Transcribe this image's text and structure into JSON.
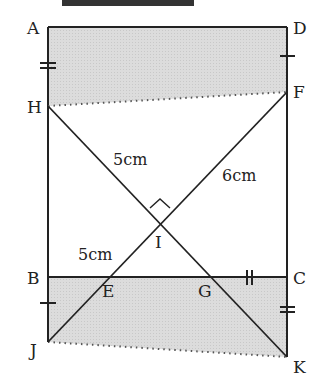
{
  "title_partial": "（切れた見出し）",
  "diagram": {
    "type": "geometry-figure",
    "points": {
      "A": {
        "label": "A",
        "x": 48,
        "y": 27
      },
      "D": {
        "label": "D",
        "x": 287,
        "y": 27
      },
      "H": {
        "label": "H",
        "x": 48,
        "y": 106
      },
      "F": {
        "label": "F",
        "x": 287,
        "y": 92
      },
      "B": {
        "label": "B",
        "x": 48,
        "y": 277
      },
      "C": {
        "label": "C",
        "x": 287,
        "y": 277
      },
      "J": {
        "label": "J",
        "x": 48,
        "y": 342
      },
      "K": {
        "label": "K",
        "x": 287,
        "y": 357
      },
      "E": {
        "label": "E",
        "x": 107,
        "y": 277
      },
      "G": {
        "label": "G",
        "x": 208,
        "y": 277
      },
      "I": {
        "label": "I",
        "x": 160,
        "y": 218
      }
    },
    "measurements": {
      "HI": "5cm",
      "IF": "6cm",
      "EI": "5cm"
    },
    "marks": {
      "right_angle_at": "I",
      "AH_tick": "double",
      "DF_tick": "single",
      "BJ_tick": "single",
      "GC_tick": "double-vertical",
      "CK_tick": "double"
    },
    "shaded_regions": [
      "A-D-F-H",
      "B-C-K-J"
    ],
    "colors": {
      "stroke": "#222222",
      "shade": "#d9d9d9",
      "dotted": "#555555"
    }
  }
}
